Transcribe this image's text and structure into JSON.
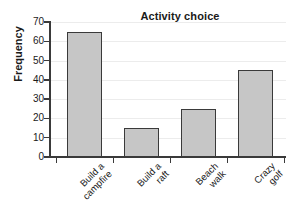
{
  "chart_data": {
    "type": "bar",
    "title": "Activity choice",
    "xlabel": "",
    "ylabel": "Frequency",
    "categories": [
      "Build a campfire",
      "Build a raft",
      "Beach walk",
      "Crazy golf"
    ],
    "category_lines": [
      [
        "Build a",
        "campfire"
      ],
      [
        "Build a",
        "raft"
      ],
      [
        "Beach",
        "walk"
      ],
      [
        "Crazy",
        "golf"
      ]
    ],
    "values": [
      65,
      15,
      25,
      45
    ],
    "ylim": [
      0,
      70
    ],
    "ytick_labels": [
      "0",
      "10",
      "20",
      "30",
      "40",
      "50",
      "60",
      "70"
    ],
    "ytick_values": [
      0,
      10,
      20,
      30,
      40,
      50,
      60,
      70
    ],
    "grid": true,
    "legend": false,
    "bar_fill_color": "#c6c6c6",
    "bar_edge_color": "#3a3a3a",
    "gridline_color": "#ececec",
    "background_color": "#ffffff",
    "text_color": "#1a1a1a"
  }
}
